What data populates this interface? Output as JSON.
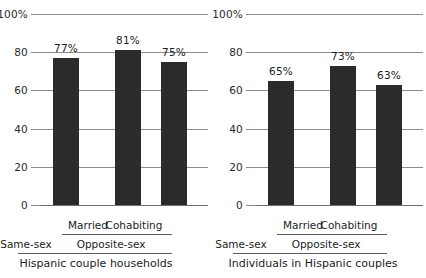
{
  "chart_data": [
    {
      "type": "bar",
      "title": "Hispanic couple households",
      "panel": "left",
      "categories": [
        "Same-sex",
        "Married",
        "Cohabiting"
      ],
      "values": [
        77,
        81,
        75
      ],
      "data_labels": [
        "77%",
        "81%",
        "75%"
      ],
      "groups": [
        {
          "label": "Same-sex",
          "members": [
            "Same-sex"
          ]
        },
        {
          "label": "Opposite-sex",
          "members": [
            "Married",
            "Cohabiting"
          ]
        }
      ],
      "xlabel": "",
      "ylabel": "",
      "ylim": [
        0,
        100
      ],
      "yticks": [
        0,
        20,
        40,
        60,
        80,
        100
      ],
      "ytick_labels": [
        "0",
        "20",
        "40",
        "60",
        "80",
        "100%"
      ],
      "grid": true,
      "legend": "none"
    },
    {
      "type": "bar",
      "title": "Individuals in Hispanic couples",
      "panel": "right",
      "categories": [
        "Same-sex",
        "Married",
        "Cohabiting"
      ],
      "values": [
        65,
        73,
        63
      ],
      "data_labels": [
        "65%",
        "73%",
        "63%"
      ],
      "groups": [
        {
          "label": "Same-sex",
          "members": [
            "Same-sex"
          ]
        },
        {
          "label": "Opposite-sex",
          "members": [
            "Married",
            "Cohabiting"
          ]
        }
      ],
      "xlabel": "",
      "ylabel": "",
      "ylim": [
        0,
        100
      ],
      "yticks": [
        0,
        20,
        40,
        60,
        80,
        100
      ],
      "ytick_labels": [
        "0",
        "20",
        "40",
        "60",
        "80",
        "100%"
      ],
      "grid": true,
      "legend": "none"
    }
  ],
  "style": {
    "bar_color": "#2b2b2b",
    "axis_color": "#8c8c8c",
    "rule_color": "#5f5f5f",
    "text_color": "#1c1c1c",
    "background": "#ffffff"
  }
}
